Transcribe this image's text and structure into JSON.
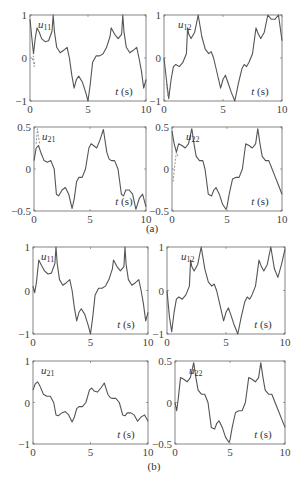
{
  "figure": {
    "caption_a": "(a)",
    "caption_b": "(b)",
    "line_color": "#555555",
    "dashed_color": "#777777"
  },
  "chart_data": [
    {
      "id": "a_u11",
      "group": "(a)",
      "type": "line",
      "title": "u11",
      "xlabel": "t (s)",
      "ylabel": "",
      "xlim": [
        0,
        10
      ],
      "ylim": [
        -1,
        1
      ],
      "xticks": [
        "0",
        "5",
        "10"
      ],
      "yticks": [
        "-1",
        "0",
        "1"
      ],
      "box": [
        30,
        15,
        146,
        101
      ],
      "x": [
        0,
        0.15,
        0.3,
        0.45,
        0.6,
        0.8,
        1.0,
        1.3,
        1.6,
        1.9,
        2.0,
        2.1,
        2.3,
        2.6,
        2.9,
        3.2,
        3.4,
        3.6,
        3.8,
        4.0,
        4.2,
        4.5,
        4.8,
        5.0,
        5.2,
        5.4,
        5.7,
        6.0,
        6.3,
        6.6,
        6.9,
        7.0,
        7.3,
        7.6,
        7.9,
        8.0,
        8.1,
        8.3,
        8.6,
        8.9,
        9.2,
        9.4,
        9.6,
        9.8,
        10.0
      ],
      "series": [
        {
          "name": "solid",
          "values": [
            0.9,
            0.5,
            0.1,
            0.45,
            0.7,
            0.6,
            0.45,
            0.38,
            0.4,
            0.62,
            1.0,
            0.62,
            0.25,
            0.12,
            0.18,
            0.25,
            0.0,
            -0.4,
            -0.7,
            -0.5,
            -0.42,
            -0.55,
            -0.8,
            -1.0,
            -0.6,
            -0.1,
            0.05,
            0.05,
            0.1,
            0.25,
            0.5,
            0.7,
            0.55,
            0.45,
            0.55,
            1.0,
            0.6,
            0.25,
            0.12,
            0.18,
            0.25,
            0.0,
            -0.3,
            -0.7,
            -0.5
          ]
        },
        {
          "name": "dashed",
          "x": [
            0.2,
            0.3,
            0.35,
            0.4
          ],
          "values": [
            -0.05,
            0.05,
            -0.2,
            -0.1
          ]
        }
      ]
    },
    {
      "id": "a_u12",
      "group": "(a)",
      "type": "line",
      "title": "u12",
      "xlabel": "t (s)",
      "xlim": [
        0,
        10
      ],
      "ylim": [
        -1,
        1
      ],
      "xticks": [
        "0",
        "5",
        "10"
      ],
      "yticks": [
        "-1",
        "0",
        "1"
      ],
      "box": [
        164,
        15,
        282,
        101
      ],
      "x": [
        0,
        0.2,
        0.4,
        0.6,
        0.8,
        1.0,
        1.3,
        1.6,
        1.9,
        2.0,
        2.1,
        2.3,
        2.6,
        2.9,
        3.2,
        3.5,
        3.8,
        4.0,
        4.2,
        4.5,
        4.8,
        5.0,
        5.2,
        5.4,
        5.7,
        6.0,
        6.3,
        6.6,
        6.8,
        7.0,
        7.2,
        7.5,
        7.8,
        8.0,
        8.2,
        8.5,
        8.8,
        9.1,
        9.4,
        9.7,
        10.0
      ],
      "series": [
        {
          "name": "solid",
          "values": [
            0.0,
            -0.5,
            -0.95,
            -0.5,
            -0.2,
            -0.15,
            -0.2,
            -0.1,
            0.1,
            0.7,
            0.55,
            0.45,
            0.6,
            1.0,
            0.5,
            0.2,
            0.1,
            0.15,
            0.0,
            -0.35,
            -0.7,
            -0.5,
            -0.4,
            -0.55,
            -0.8,
            -1.0,
            -0.6,
            -0.25,
            -0.15,
            -0.2,
            -0.1,
            0.1,
            0.7,
            0.55,
            0.45,
            0.6,
            1.0,
            0.9,
            0.9,
            1.0,
            0.4
          ]
        },
        {
          "name": "dashed",
          "x": [
            0.2,
            0.35,
            0.5
          ],
          "values": [
            -0.6,
            -0.9,
            -0.7
          ]
        }
      ]
    },
    {
      "id": "a_u21",
      "group": "(a)",
      "type": "line",
      "title": "u21",
      "xlabel": "t (s)",
      "xlim": [
        0,
        10
      ],
      "ylim": [
        -0.5,
        0.5
      ],
      "xticks": [
        "0",
        "5",
        "10"
      ],
      "yticks": [
        "-0.5",
        "0",
        "0.5"
      ],
      "box": [
        34,
        127,
        146,
        211
      ],
      "x": [
        0,
        0.2,
        0.4,
        0.6,
        0.9,
        1.2,
        1.5,
        1.8,
        2.0,
        2.2,
        2.5,
        2.8,
        3.1,
        3.4,
        3.6,
        3.8,
        4.0,
        4.3,
        4.6,
        4.9,
        5.1,
        5.3,
        5.6,
        5.9,
        6.2,
        6.5,
        6.7,
        6.9,
        7.2,
        7.5,
        7.8,
        8.0,
        8.2,
        8.5,
        8.8,
        9.1,
        9.4,
        9.7,
        10.0
      ],
      "series": [
        {
          "name": "solid",
          "values": [
            0.1,
            0.25,
            0.28,
            0.2,
            0.1,
            0.08,
            0.1,
            0.0,
            -0.3,
            -0.32,
            -0.25,
            -0.22,
            -0.3,
            -0.47,
            -0.35,
            -0.15,
            -0.1,
            -0.1,
            0.0,
            0.25,
            0.3,
            0.28,
            0.25,
            0.35,
            0.47,
            0.2,
            0.12,
            0.1,
            0.1,
            0.0,
            -0.3,
            -0.32,
            -0.25,
            -0.25,
            -0.3,
            -0.48,
            -0.35,
            -0.3,
            -0.45
          ]
        },
        {
          "name": "dashed",
          "x": [
            0.2,
            0.3,
            0.4,
            0.5
          ],
          "values": [
            0.3,
            0.48,
            0.38,
            0.3
          ]
        }
      ]
    },
    {
      "id": "a_u22",
      "group": "(a)",
      "type": "line",
      "title": "u22",
      "xlabel": "t (s)",
      "xlim": [
        0,
        10
      ],
      "ylim": [
        -0.5,
        0.5
      ],
      "xticks": [
        "0",
        "5",
        "10"
      ],
      "yticks": [
        "-0.5",
        "0",
        "0.5"
      ],
      "box": [
        172,
        127,
        282,
        211
      ],
      "x": [
        0,
        0.2,
        0.4,
        0.6,
        0.9,
        1.2,
        1.5,
        1.8,
        2.0,
        2.2,
        2.5,
        2.8,
        3.0,
        3.3,
        3.6,
        3.8,
        4.0,
        4.3,
        4.6,
        4.9,
        5.0,
        5.2,
        5.5,
        5.8,
        6.1,
        6.4,
        6.7,
        7.0,
        7.3,
        7.6,
        7.8,
        8.0,
        8.2,
        8.5,
        8.8,
        9.1,
        9.4,
        9.7,
        10.0
      ],
      "series": [
        {
          "name": "solid",
          "values": [
            0.45,
            0.3,
            0.2,
            0.3,
            0.28,
            0.25,
            0.3,
            0.48,
            0.3,
            0.15,
            0.1,
            0.1,
            0.0,
            -0.3,
            -0.32,
            -0.25,
            -0.22,
            -0.3,
            -0.42,
            -0.48,
            -0.45,
            -0.3,
            -0.12,
            -0.1,
            -0.1,
            0.0,
            0.3,
            0.28,
            0.25,
            0.3,
            0.48,
            0.3,
            0.15,
            0.1,
            0.1,
            0.0,
            -0.1,
            -0.2,
            -0.3
          ]
        },
        {
          "name": "dashed",
          "x": [
            0.1,
            0.25,
            0.4,
            0.55
          ],
          "values": [
            -0.15,
            0.05,
            0.2,
            0.15
          ]
        }
      ]
    },
    {
      "id": "b_u11",
      "group": "(b)",
      "type": "line",
      "title": "u11",
      "xlabel": "t (s)",
      "xlim": [
        0,
        10
      ],
      "ylim": [
        -1,
        1
      ],
      "xticks": [
        "0",
        "5",
        "10"
      ],
      "yticks": [
        "-1",
        "0",
        "1"
      ],
      "box": [
        33,
        247,
        148,
        334
      ],
      "x": [
        0,
        0.15,
        0.3,
        0.5,
        0.7,
        1.0,
        1.3,
        1.6,
        1.9,
        2.0,
        2.1,
        2.3,
        2.6,
        2.9,
        3.2,
        3.4,
        3.6,
        3.8,
        4.0,
        4.2,
        4.5,
        4.8,
        5.0,
        5.2,
        5.4,
        5.7,
        6.0,
        6.3,
        6.6,
        6.9,
        7.0,
        7.3,
        7.6,
        7.9,
        8.0,
        8.1,
        8.3,
        8.6,
        8.9,
        9.2,
        9.4,
        9.6,
        9.8,
        10.0
      ],
      "series": [
        {
          "name": "solid",
          "values": [
            0.1,
            -0.05,
            0.2,
            0.7,
            0.6,
            0.45,
            0.38,
            0.4,
            0.62,
            1.0,
            0.62,
            0.25,
            0.12,
            0.18,
            0.25,
            0.0,
            -0.4,
            -0.7,
            -0.5,
            -0.42,
            -0.55,
            -0.8,
            -1.0,
            -0.6,
            -0.1,
            0.05,
            0.05,
            0.1,
            0.25,
            0.5,
            0.7,
            0.55,
            0.45,
            0.55,
            1.0,
            0.6,
            0.25,
            0.12,
            0.18,
            0.25,
            0.0,
            -0.3,
            -0.7,
            -0.5
          ]
        }
      ]
    },
    {
      "id": "b_u12",
      "group": "(b)",
      "type": "line",
      "title": "u12",
      "xlabel": "t (s)",
      "xlim": [
        0,
        10
      ],
      "ylim": [
        -1,
        1
      ],
      "xticks": [
        "0",
        "5",
        "10"
      ],
      "yticks": [
        "-1",
        "0",
        "1"
      ],
      "box": [
        167,
        247,
        285,
        334
      ],
      "x": [
        0,
        0.2,
        0.4,
        0.6,
        0.8,
        1.0,
        1.3,
        1.6,
        1.9,
        2.0,
        2.1,
        2.3,
        2.6,
        2.9,
        3.2,
        3.5,
        3.8,
        4.0,
        4.2,
        4.5,
        4.8,
        5.0,
        5.2,
        5.4,
        5.7,
        6.0,
        6.3,
        6.6,
        6.8,
        7.0,
        7.2,
        7.5,
        7.8,
        8.0,
        8.2,
        8.5,
        8.8,
        9.1,
        9.4,
        9.7,
        10.0
      ],
      "series": [
        {
          "name": "solid",
          "values": [
            0.0,
            -0.6,
            -0.95,
            -0.5,
            -0.2,
            -0.15,
            -0.2,
            -0.1,
            0.1,
            0.7,
            0.55,
            0.45,
            0.6,
            1.0,
            0.5,
            0.2,
            0.1,
            0.15,
            0.0,
            -0.35,
            -0.7,
            -0.5,
            -0.4,
            -0.55,
            -0.8,
            -1.0,
            -0.6,
            -0.25,
            -0.15,
            -0.2,
            -0.1,
            0.1,
            0.7,
            0.55,
            0.45,
            0.6,
            1.0,
            0.5,
            0.3,
            0.6,
            0.95
          ]
        }
      ]
    },
    {
      "id": "b_u21",
      "group": "(b)",
      "type": "line",
      "title": "u21",
      "xlabel": "t (s)",
      "xlim": [
        0,
        10
      ],
      "ylim": [
        -1,
        1
      ],
      "xticks": [
        "0",
        "5",
        "10"
      ],
      "yticks": [
        "-1",
        "0",
        "1"
      ],
      "box": [
        33,
        361,
        148,
        444
      ],
      "x": [
        0,
        0.2,
        0.4,
        0.6,
        0.9,
        1.2,
        1.5,
        1.8,
        2.0,
        2.2,
        2.5,
        2.8,
        3.1,
        3.4,
        3.6,
        3.8,
        4.0,
        4.3,
        4.6,
        4.9,
        5.1,
        5.3,
        5.6,
        5.9,
        6.2,
        6.5,
        6.7,
        6.9,
        7.2,
        7.5,
        7.8,
        8.0,
        8.2,
        8.5,
        8.8,
        9.1,
        9.4,
        9.7,
        10.0
      ],
      "series": [
        {
          "name": "solid",
          "values": [
            0.3,
            0.45,
            0.5,
            0.4,
            0.2,
            0.15,
            0.15,
            0.0,
            -0.3,
            -0.32,
            -0.25,
            -0.22,
            -0.3,
            -0.47,
            -0.35,
            -0.15,
            -0.1,
            -0.1,
            0.0,
            0.3,
            0.35,
            0.28,
            0.25,
            0.35,
            0.47,
            0.2,
            0.12,
            0.1,
            0.1,
            0.0,
            -0.3,
            -0.32,
            -0.25,
            -0.25,
            -0.3,
            -0.45,
            -0.35,
            -0.3,
            -0.45
          ]
        }
      ]
    },
    {
      "id": "b_u22",
      "group": "(b)",
      "type": "line",
      "title": "u22",
      "xlabel": "t (s)",
      "xlim": [
        0,
        10
      ],
      "ylim": [
        -0.5,
        0.5
      ],
      "xticks": [
        "0",
        "5",
        "10"
      ],
      "yticks": [
        "-0.5",
        "0",
        "0.5"
      ],
      "box": [
        175,
        361,
        285,
        444
      ],
      "x": [
        0,
        0.15,
        0.3,
        0.5,
        0.8,
        1.1,
        1.4,
        1.7,
        1.9,
        2.1,
        2.4,
        2.7,
        3.0,
        3.3,
        3.6,
        3.8,
        4.0,
        4.3,
        4.6,
        4.9,
        5.0,
        5.2,
        5.5,
        5.8,
        6.1,
        6.4,
        6.7,
        7.0,
        7.3,
        7.6,
        7.8,
        8.0,
        8.2,
        8.5,
        8.8,
        9.1,
        9.4,
        9.7,
        10.0
      ],
      "series": [
        {
          "name": "solid",
          "values": [
            0.0,
            -0.1,
            0.05,
            0.3,
            0.28,
            0.25,
            0.3,
            0.48,
            0.3,
            0.15,
            0.1,
            0.1,
            0.0,
            -0.3,
            -0.32,
            -0.25,
            -0.22,
            -0.3,
            -0.42,
            -0.48,
            -0.45,
            -0.3,
            -0.12,
            -0.1,
            -0.1,
            0.0,
            0.3,
            0.28,
            0.25,
            0.3,
            0.48,
            0.3,
            0.15,
            0.1,
            0.1,
            0.0,
            -0.1,
            -0.2,
            -0.3
          ]
        }
      ]
    }
  ]
}
